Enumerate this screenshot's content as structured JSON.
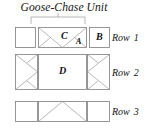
{
  "title": "Goose-Chase Unit",
  "rows": [
    {
      "label": "Row",
      "number": "1",
      "patches": [
        {
          "letter": "",
          "shape": "plain-square"
        },
        {
          "letter": "C",
          "shape": "goose-chase-unit"
        },
        {
          "letter": "A",
          "shape": "corner-triangle"
        },
        {
          "letter": "B",
          "shape": "plain-square"
        }
      ]
    },
    {
      "label": "Row",
      "number": "2",
      "patches": [
        {
          "letter": "",
          "shape": "flying-geese-right"
        },
        {
          "letter": "D",
          "shape": "plain-square"
        },
        {
          "letter": "",
          "shape": "flying-geese-left"
        }
      ]
    },
    {
      "label": "Row",
      "number": "3",
      "patches": [
        {
          "letter": "",
          "shape": "plain-square"
        },
        {
          "letter": "",
          "shape": "flying-geese-up"
        },
        {
          "letter": "",
          "shape": "plain-square"
        }
      ]
    }
  ],
  "letters": {
    "a": "A",
    "b": "B",
    "c": "C",
    "d": "D"
  },
  "colors": {
    "outline": "#7d7d7d",
    "seam": "#9a9a9a",
    "fill": "#ffffff",
    "text": "#141414"
  }
}
